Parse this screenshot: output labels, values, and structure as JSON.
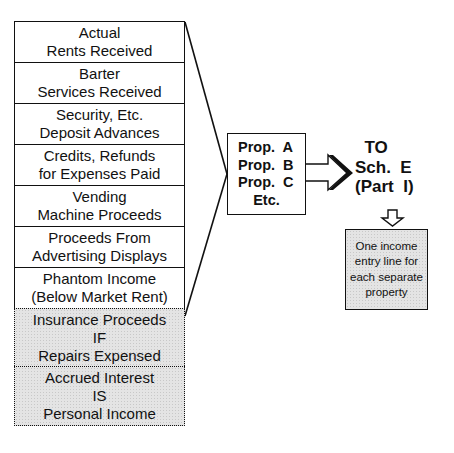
{
  "income_items": [
    {
      "lines": [
        "Actual",
        "Rents Received"
      ],
      "shaded": false
    },
    {
      "lines": [
        "Barter",
        "Services Received"
      ],
      "shaded": false
    },
    {
      "lines": [
        "Security, Etc.",
        "Deposit Advances"
      ],
      "shaded": false
    },
    {
      "lines": [
        "Credits, Refunds",
        "for Expenses Paid"
      ],
      "shaded": false
    },
    {
      "lines": [
        "Vending",
        "Machine Proceeds"
      ],
      "shaded": false
    },
    {
      "lines": [
        "Proceeds From",
        "Advertising Displays"
      ],
      "shaded": false
    },
    {
      "lines": [
        "Phantom Income",
        "(Below Market Rent)"
      ],
      "shaded": false
    },
    {
      "lines": [
        "Insurance Proceeds",
        "IF",
        "Repairs Expensed"
      ],
      "shaded": true
    },
    {
      "lines": [
        "Accrued Interest",
        "IS",
        "Personal Income"
      ],
      "shaded": true
    }
  ],
  "properties": {
    "lines": [
      "Prop.  A",
      "Prop.  B",
      "Prop.  C"
    ],
    "etc": "Etc."
  },
  "destination": {
    "lines": [
      "  TO",
      "Sch.  E",
      "(Part  I)"
    ]
  },
  "note": {
    "lines": [
      "One income",
      "entry line for",
      "each separate",
      "property"
    ]
  }
}
